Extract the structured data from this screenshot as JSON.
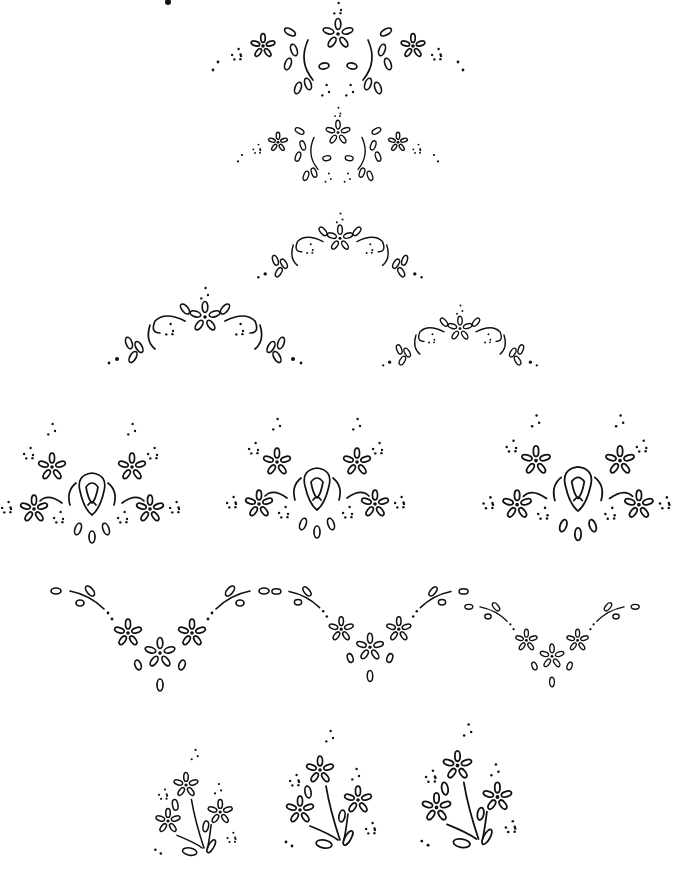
{
  "page": {
    "title": "",
    "background": "#ffffff",
    "ink": "#111111",
    "corner_mark": {
      "x": 168,
      "y": 2
    }
  },
  "motifs": [
    {
      "name": "border-top-1",
      "type": "wide-oval",
      "cx": 338,
      "cy": 52,
      "w": 250,
      "h": 90,
      "s": 1.0
    },
    {
      "name": "border-top-2",
      "type": "wide-oval",
      "cx": 338,
      "cy": 147,
      "w": 200,
      "h": 70,
      "s": 0.8
    },
    {
      "name": "border-arch-1",
      "type": "arch",
      "cx": 340,
      "cy": 245,
      "w": 200,
      "h": 70,
      "s": 0.85
    },
    {
      "name": "border-arch-2",
      "type": "arch",
      "cx": 205,
      "cy": 325,
      "w": 200,
      "h": 90,
      "s": 1.0
    },
    {
      "name": "border-arch-3",
      "type": "arch",
      "cx": 460,
      "cy": 335,
      "w": 160,
      "h": 70,
      "s": 0.8
    },
    {
      "name": "rose-spray-1",
      "type": "rose",
      "cx": 92,
      "cy": 495,
      "w": 190,
      "h": 130,
      "s": 1.0
    },
    {
      "name": "rose-spray-2",
      "type": "rose",
      "cx": 317,
      "cy": 490,
      "w": 190,
      "h": 130,
      "s": 1.0
    },
    {
      "name": "rose-spray-3",
      "type": "rose",
      "cx": 578,
      "cy": 490,
      "w": 220,
      "h": 130,
      "s": 1.05
    },
    {
      "name": "v-border-1",
      "type": "vee",
      "cx": 160,
      "cy": 645,
      "w": 220,
      "h": 110,
      "s": 1.0
    },
    {
      "name": "v-border-2",
      "type": "vee",
      "cx": 370,
      "cy": 640,
      "w": 180,
      "h": 100,
      "s": 0.9
    },
    {
      "name": "v-border-3",
      "type": "vee",
      "cx": 552,
      "cy": 650,
      "w": 140,
      "h": 100,
      "s": 0.8
    },
    {
      "name": "bouquet-1",
      "type": "bouquet",
      "cx": 195,
      "cy": 830,
      "w": 110,
      "h": 110,
      "s": 0.9
    },
    {
      "name": "bouquet-2",
      "type": "bouquet",
      "cx": 330,
      "cy": 820,
      "w": 120,
      "h": 130,
      "s": 1.0
    },
    {
      "name": "bouquet-3",
      "type": "bouquet",
      "cx": 468,
      "cy": 818,
      "w": 130,
      "h": 140,
      "s": 1.05
    }
  ]
}
